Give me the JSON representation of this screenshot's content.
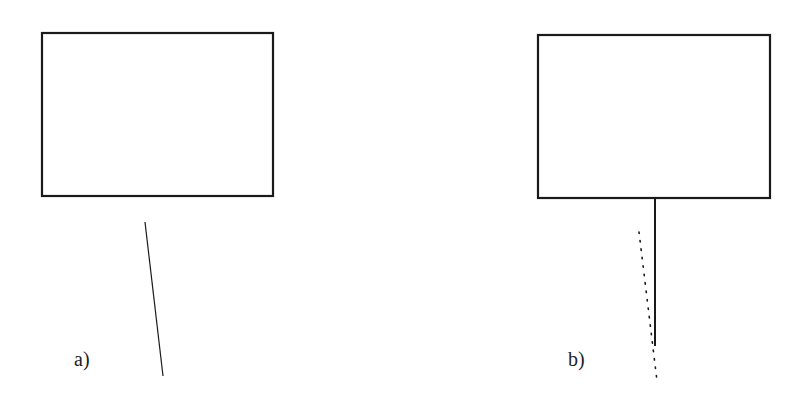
{
  "panels": [
    {
      "id": "a",
      "label": "a)"
    },
    {
      "id": "b",
      "label": "b)"
    }
  ],
  "colors": {
    "stroke": "#1a1a1a",
    "background": "#ffffff"
  }
}
